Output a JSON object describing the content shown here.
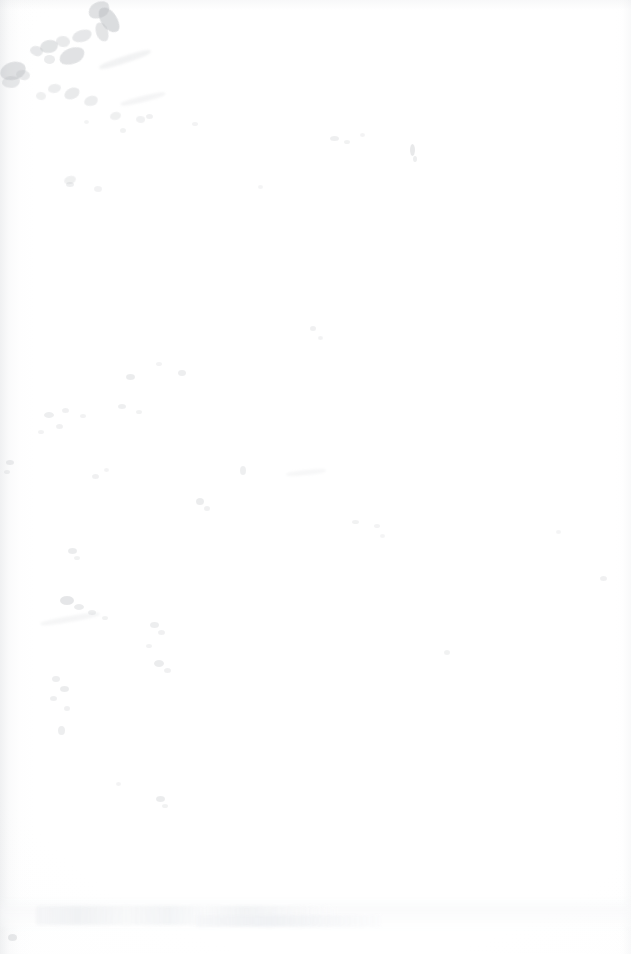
{
  "page": {
    "kind": "blank-scanned-page",
    "description": "Blank page from a document scan. No headings, body text, figures, tables, captions, page numbers, headers or footers are legible.",
    "width_px": 631,
    "height_px": 954,
    "background_color": "#ffffff",
    "has_legible_text": false,
    "visible_text": "",
    "page_number_visible": false
  },
  "artifacts": {
    "summary": "Scan defects only: a gray stain cluster in the upper-left corner, scattered dust specks across the left and centre of the sheet, gutter shading on the left edge, and a faint illegible show-through band near the bottom.",
    "stain_cluster": {
      "label": "upper-left stain cluster",
      "region": "top-left corner",
      "approx_bounds_px": [
        0,
        0,
        210,
        230
      ],
      "color": "#b9bcc0",
      "blots": [
        {
          "x": 88,
          "y": 2,
          "w": 22,
          "h": 16,
          "opacity": 0.44,
          "rot": -28
        },
        {
          "x": 101,
          "y": 6,
          "w": 16,
          "h": 28,
          "opacity": 0.5,
          "rot": -34
        },
        {
          "x": 96,
          "y": 22,
          "w": 12,
          "h": 20,
          "opacity": 0.38,
          "rot": -20
        },
        {
          "x": 72,
          "y": 30,
          "w": 20,
          "h": 12,
          "opacity": 0.34,
          "rot": -18
        },
        {
          "x": 56,
          "y": 36,
          "w": 14,
          "h": 11,
          "opacity": 0.3,
          "rot": 8
        },
        {
          "x": 40,
          "y": 40,
          "w": 18,
          "h": 13,
          "opacity": 0.4,
          "rot": -12
        },
        {
          "x": 30,
          "y": 46,
          "w": 13,
          "h": 10,
          "opacity": 0.33,
          "rot": 14
        },
        {
          "x": 59,
          "y": 48,
          "w": 26,
          "h": 16,
          "opacity": 0.42,
          "rot": -22
        },
        {
          "x": 44,
          "y": 55,
          "w": 11,
          "h": 9,
          "opacity": 0.28,
          "rot": 0
        },
        {
          "x": 0,
          "y": 62,
          "w": 26,
          "h": 18,
          "opacity": 0.44,
          "rot": -16
        },
        {
          "x": 16,
          "y": 70,
          "w": 14,
          "h": 10,
          "opacity": 0.3,
          "rot": 10
        },
        {
          "x": 2,
          "y": 76,
          "w": 18,
          "h": 12,
          "opacity": 0.34,
          "rot": -6
        },
        {
          "x": 48,
          "y": 84,
          "w": 13,
          "h": 9,
          "opacity": 0.26,
          "rot": -10
        },
        {
          "x": 64,
          "y": 88,
          "w": 16,
          "h": 11,
          "opacity": 0.3,
          "rot": -24
        },
        {
          "x": 84,
          "y": 96,
          "w": 14,
          "h": 10,
          "opacity": 0.26,
          "rot": -18
        },
        {
          "x": 36,
          "y": 92,
          "w": 10,
          "h": 8,
          "opacity": 0.22,
          "rot": 6
        },
        {
          "x": 110,
          "y": 112,
          "w": 11,
          "h": 8,
          "opacity": 0.22,
          "rot": -14
        },
        {
          "x": 136,
          "y": 116,
          "w": 9,
          "h": 7,
          "opacity": 0.2,
          "rot": 4
        },
        {
          "x": 64,
          "y": 176,
          "w": 12,
          "h": 8,
          "opacity": 0.22,
          "rot": -16
        },
        {
          "x": 94,
          "y": 186,
          "w": 8,
          "h": 6,
          "opacity": 0.18,
          "rot": 0
        }
      ]
    },
    "specks": [
      {
        "x": 330,
        "y": 136,
        "w": 9,
        "h": 5,
        "opacity": 0.22
      },
      {
        "x": 344,
        "y": 140,
        "w": 6,
        "h": 4,
        "opacity": 0.18
      },
      {
        "x": 360,
        "y": 133,
        "w": 5,
        "h": 4,
        "opacity": 0.16
      },
      {
        "x": 410,
        "y": 144,
        "w": 5,
        "h": 12,
        "opacity": 0.3
      },
      {
        "x": 413,
        "y": 156,
        "w": 4,
        "h": 6,
        "opacity": 0.24
      },
      {
        "x": 258,
        "y": 185,
        "w": 5,
        "h": 4,
        "opacity": 0.14
      },
      {
        "x": 66,
        "y": 182,
        "w": 8,
        "h": 5,
        "opacity": 0.22
      },
      {
        "x": 146,
        "y": 114,
        "w": 7,
        "h": 5,
        "opacity": 0.2
      },
      {
        "x": 192,
        "y": 122,
        "w": 6,
        "h": 4,
        "opacity": 0.16
      },
      {
        "x": 120,
        "y": 128,
        "w": 6,
        "h": 5,
        "opacity": 0.18
      },
      {
        "x": 84,
        "y": 120,
        "w": 5,
        "h": 4,
        "opacity": 0.15
      },
      {
        "x": 310,
        "y": 326,
        "w": 6,
        "h": 5,
        "opacity": 0.2
      },
      {
        "x": 318,
        "y": 336,
        "w": 5,
        "h": 4,
        "opacity": 0.17
      },
      {
        "x": 126,
        "y": 374,
        "w": 9,
        "h": 6,
        "opacity": 0.26
      },
      {
        "x": 178,
        "y": 370,
        "w": 8,
        "h": 6,
        "opacity": 0.24
      },
      {
        "x": 156,
        "y": 362,
        "w": 6,
        "h": 4,
        "opacity": 0.16
      },
      {
        "x": 44,
        "y": 412,
        "w": 10,
        "h": 6,
        "opacity": 0.24
      },
      {
        "x": 62,
        "y": 408,
        "w": 7,
        "h": 5,
        "opacity": 0.2
      },
      {
        "x": 80,
        "y": 414,
        "w": 6,
        "h": 4,
        "opacity": 0.17
      },
      {
        "x": 118,
        "y": 404,
        "w": 8,
        "h": 5,
        "opacity": 0.22
      },
      {
        "x": 136,
        "y": 410,
        "w": 6,
        "h": 4,
        "opacity": 0.18
      },
      {
        "x": 56,
        "y": 424,
        "w": 7,
        "h": 5,
        "opacity": 0.2
      },
      {
        "x": 38,
        "y": 430,
        "w": 6,
        "h": 4,
        "opacity": 0.17
      },
      {
        "x": 6,
        "y": 460,
        "w": 8,
        "h": 5,
        "opacity": 0.26
      },
      {
        "x": 4,
        "y": 470,
        "w": 6,
        "h": 4,
        "opacity": 0.2
      },
      {
        "x": 92,
        "y": 474,
        "w": 7,
        "h": 5,
        "opacity": 0.2
      },
      {
        "x": 104,
        "y": 468,
        "w": 5,
        "h": 4,
        "opacity": 0.16
      },
      {
        "x": 240,
        "y": 466,
        "w": 6,
        "h": 9,
        "opacity": 0.22
      },
      {
        "x": 196,
        "y": 498,
        "w": 8,
        "h": 7,
        "opacity": 0.26
      },
      {
        "x": 204,
        "y": 506,
        "w": 6,
        "h": 5,
        "opacity": 0.2
      },
      {
        "x": 352,
        "y": 520,
        "w": 7,
        "h": 4,
        "opacity": 0.18
      },
      {
        "x": 374,
        "y": 524,
        "w": 6,
        "h": 4,
        "opacity": 0.16
      },
      {
        "x": 380,
        "y": 534,
        "w": 5,
        "h": 4,
        "opacity": 0.14
      },
      {
        "x": 556,
        "y": 530,
        "w": 5,
        "h": 4,
        "opacity": 0.14
      },
      {
        "x": 600,
        "y": 576,
        "w": 7,
        "h": 5,
        "opacity": 0.2
      },
      {
        "x": 68,
        "y": 548,
        "w": 9,
        "h": 6,
        "opacity": 0.26
      },
      {
        "x": 74,
        "y": 556,
        "w": 6,
        "h": 4,
        "opacity": 0.18
      },
      {
        "x": 60,
        "y": 596,
        "w": 14,
        "h": 9,
        "opacity": 0.34
      },
      {
        "x": 74,
        "y": 604,
        "w": 10,
        "h": 6,
        "opacity": 0.26
      },
      {
        "x": 88,
        "y": 610,
        "w": 8,
        "h": 5,
        "opacity": 0.22
      },
      {
        "x": 102,
        "y": 616,
        "w": 6,
        "h": 4,
        "opacity": 0.18
      },
      {
        "x": 150,
        "y": 622,
        "w": 9,
        "h": 6,
        "opacity": 0.24
      },
      {
        "x": 158,
        "y": 630,
        "w": 7,
        "h": 5,
        "opacity": 0.2
      },
      {
        "x": 146,
        "y": 644,
        "w": 6,
        "h": 4,
        "opacity": 0.17
      },
      {
        "x": 154,
        "y": 660,
        "w": 10,
        "h": 7,
        "opacity": 0.26
      },
      {
        "x": 164,
        "y": 668,
        "w": 7,
        "h": 5,
        "opacity": 0.2
      },
      {
        "x": 52,
        "y": 676,
        "w": 8,
        "h": 6,
        "opacity": 0.24
      },
      {
        "x": 60,
        "y": 686,
        "w": 9,
        "h": 6,
        "opacity": 0.26
      },
      {
        "x": 50,
        "y": 696,
        "w": 7,
        "h": 5,
        "opacity": 0.22
      },
      {
        "x": 64,
        "y": 706,
        "w": 6,
        "h": 5,
        "opacity": 0.2
      },
      {
        "x": 58,
        "y": 726,
        "w": 7,
        "h": 9,
        "opacity": 0.24
      },
      {
        "x": 444,
        "y": 650,
        "w": 6,
        "h": 5,
        "opacity": 0.18
      },
      {
        "x": 116,
        "y": 782,
        "w": 5,
        "h": 4,
        "opacity": 0.16
      },
      {
        "x": 156,
        "y": 796,
        "w": 9,
        "h": 6,
        "opacity": 0.26
      },
      {
        "x": 162,
        "y": 804,
        "w": 6,
        "h": 4,
        "opacity": 0.18
      },
      {
        "x": 8,
        "y": 934,
        "w": 9,
        "h": 7,
        "opacity": 0.3
      }
    ],
    "streaks": [
      {
        "x": 98,
        "y": 56,
        "w": 54,
        "h": 7,
        "opacity": 0.22,
        "rot": -18
      },
      {
        "x": 120,
        "y": 96,
        "w": 46,
        "h": 6,
        "opacity": 0.18,
        "rot": -14
      },
      {
        "x": 40,
        "y": 616,
        "w": 60,
        "h": 6,
        "opacity": 0.16,
        "rot": -10
      },
      {
        "x": 286,
        "y": 470,
        "w": 40,
        "h": 5,
        "opacity": 0.14,
        "rot": -6
      }
    ],
    "gutter_shading": {
      "edge": "left",
      "width_px": 34,
      "color": "#cdd0d4"
    },
    "show_through_band": {
      "label": "illegible show-through / bleed band",
      "approx_bounds_px": [
        36,
        906,
        300,
        19
      ],
      "legible": false,
      "note": "Ghost of text printed on the reverse side of the leaf; no characters are resolvable."
    }
  }
}
